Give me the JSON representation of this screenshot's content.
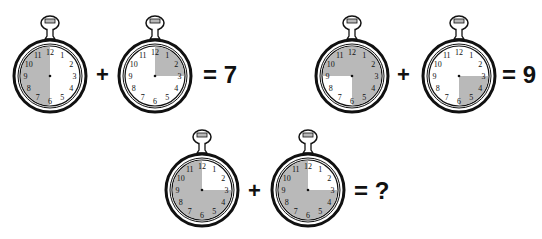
{
  "puzzle": {
    "colors": {
      "shade": "#b9b9b9",
      "ink": "#111111",
      "face": "#ffffff"
    },
    "numerals": [
      "12",
      "1",
      "2",
      "3",
      "4",
      "5",
      "6",
      "7",
      "8",
      "9",
      "10",
      "11"
    ],
    "equations": [
      {
        "clocks": [
          {
            "shaded_quadrants": [
              "6-9",
              "9-12"
            ],
            "description": "left half shaded"
          },
          {
            "shaded_quadrants": [
              "12-3"
            ],
            "description": "top-right quarter shaded"
          }
        ],
        "plus": "+",
        "result": "= 7"
      },
      {
        "clocks": [
          {
            "shaded_quadrants": [
              "12-3",
              "3-6",
              "9-12"
            ],
            "description": "all shaded except bottom-left quarter"
          },
          {
            "shaded_quadrants": [
              "3-6"
            ],
            "description": "bottom-right quarter shaded"
          }
        ],
        "plus": "+",
        "result": "= 9"
      },
      {
        "clocks": [
          {
            "shaded_quadrants": [
              "3-6",
              "6-9",
              "9-12"
            ],
            "description": "all shaded except top-right quarter"
          },
          {
            "shaded_quadrants": [
              "3-6",
              "6-9",
              "9-12"
            ],
            "description": "all shaded except top-right quarter"
          }
        ],
        "plus": "+",
        "result": "= ?"
      }
    ]
  }
}
